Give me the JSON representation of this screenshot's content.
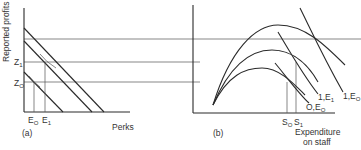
{
  "panel_a": {
    "tag": "(a)",
    "y_axis_label": "Reported profits",
    "x_axis_label": "Perks",
    "y_ticks": [
      {
        "main": "Z",
        "sub": "1"
      },
      {
        "main": "Z",
        "sub": "O"
      }
    ],
    "x_ticks": [
      {
        "main": "E",
        "sub": "O"
      },
      {
        "main": "E",
        "sub": "1"
      }
    ]
  },
  "panel_b": {
    "tag": "(b)",
    "x_axis_label_line1": "Expenditure",
    "x_axis_label_line2": "on staff",
    "x_ticks": [
      {
        "main": "S",
        "sub": "O"
      },
      {
        "main": "S",
        "sub": "1"
      }
    ],
    "curve_labels": [
      {
        "main": "O,E",
        "sub": "O"
      },
      {
        "main": "1,E",
        "sub": "1"
      },
      {
        "main": "1,E",
        "sub": "O"
      }
    ]
  }
}
